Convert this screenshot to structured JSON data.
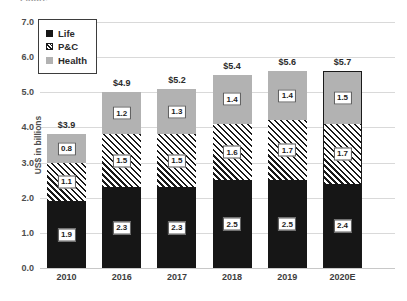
{
  "title_sliver": "Figure",
  "chart_data": {
    "type": "bar",
    "subtype": "stacked-column",
    "title": "",
    "xlabel": "",
    "ylabel": "US$ in billions",
    "ylim": [
      0.0,
      7.0
    ],
    "ytick_labels": [
      "0.0",
      "1.0",
      "2.0",
      "3.0",
      "4.0",
      "5.0",
      "6.0",
      "7.0"
    ],
    "ytick_values": [
      0.0,
      1.0,
      2.0,
      3.0,
      4.0,
      5.0,
      6.0,
      7.0
    ],
    "grid": true,
    "legend_position": "top-left",
    "categories": [
      "2010",
      "2016",
      "2017",
      "2018",
      "2019",
      "2020E"
    ],
    "series": [
      {
        "name": "Life",
        "values": [
          1.9,
          2.3,
          2.3,
          2.5,
          2.5,
          2.4
        ],
        "labels": [
          "1.9",
          "2.3",
          "2.3",
          "2.5",
          "2.5",
          "2.4"
        ],
        "color": "#161616",
        "pattern": "solid"
      },
      {
        "name": "P&C",
        "values": [
          1.1,
          1.5,
          1.5,
          1.6,
          1.7,
          1.7
        ],
        "labels": [
          "1.1",
          "1.5",
          "1.5",
          "1.6",
          "1.7",
          "1.7"
        ],
        "color": "#ffffff",
        "pattern": "diagonal-hatch"
      },
      {
        "name": "Health",
        "values": [
          0.8,
          1.2,
          1.3,
          1.4,
          1.4,
          1.5
        ],
        "labels": [
          "0.8",
          "1.2",
          "1.3",
          "1.4",
          "1.4",
          "1.5"
        ],
        "color": "#b2b2b2",
        "pattern": "solid"
      }
    ],
    "totals": [
      3.9,
      4.9,
      5.2,
      5.4,
      5.6,
      5.7
    ],
    "total_labels": [
      "$3.9",
      "$4.9",
      "$5.2",
      "$5.4",
      "$5.6",
      "$5.7"
    ],
    "highlighted_category": "2020E",
    "annotations": []
  },
  "legend": {
    "items": [
      {
        "label": "Life",
        "swatch": "life-swatch"
      },
      {
        "label": "P&C",
        "swatch": "pc-swatch"
      },
      {
        "label": "Health",
        "swatch": "health-swatch"
      }
    ]
  }
}
